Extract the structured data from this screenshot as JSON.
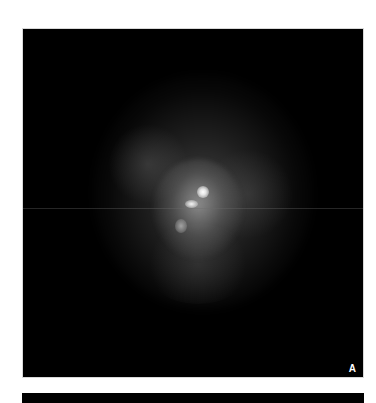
{
  "figure": {
    "panels": [
      {
        "label": "A",
        "content": "grayscale fluorescence microscopy image of a cell with diffuse glow and bright central puncta"
      },
      {
        "label": "",
        "content": "second panel (partially visible)"
      }
    ]
  }
}
